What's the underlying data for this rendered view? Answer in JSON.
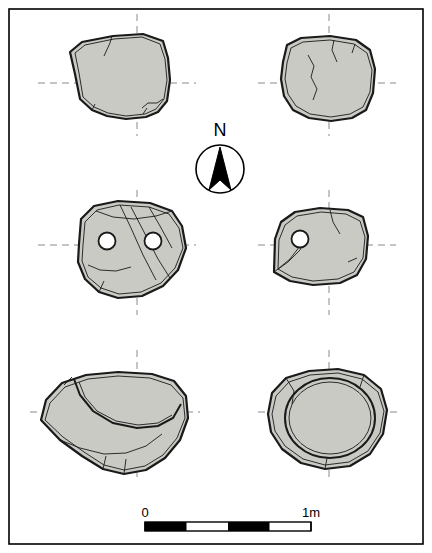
{
  "figure": {
    "type": "archaeological-stone-plan",
    "background_color": "#ffffff",
    "border_color": "#000000",
    "stone_fill": "#c9cac4",
    "stone_outline": "#1a1a1a",
    "axis_line_color": "#8a8a8a",
    "north_arrow": {
      "label": "N",
      "description": "Circle with filled triangular north pointer",
      "circle_color": "#000000",
      "fill_color": "#000000"
    },
    "scale_bar": {
      "left_label": "0",
      "right_label": "1m",
      "segments": 4,
      "description": "Alternating black and white scale bar from 0 to 1 metre"
    },
    "stones": [
      {
        "id": "stone-top-left",
        "row": 1,
        "column": 1,
        "holes": 0,
        "notes": "Roughly rectangular block with chipped lower edge"
      },
      {
        "id": "stone-top-right",
        "row": 1,
        "column": 2,
        "holes": 0,
        "notes": "Rounded rectangular block with surface cracks"
      },
      {
        "id": "stone-middle-left",
        "row": 2,
        "column": 1,
        "holes": 2,
        "notes": "Block with two circular perforations and diagonal striations"
      },
      {
        "id": "stone-middle-right",
        "row": 2,
        "column": 2,
        "holes": 1,
        "notes": "Wedge-shaped block with single circular perforation"
      },
      {
        "id": "stone-bottom-left",
        "row": 3,
        "column": 1,
        "holes": 0,
        "notes": "Block with large curved incised arc"
      },
      {
        "id": "stone-bottom-right",
        "row": 3,
        "column": 2,
        "holes": 0,
        "notes": "Block with large circular incised ring"
      }
    ]
  }
}
